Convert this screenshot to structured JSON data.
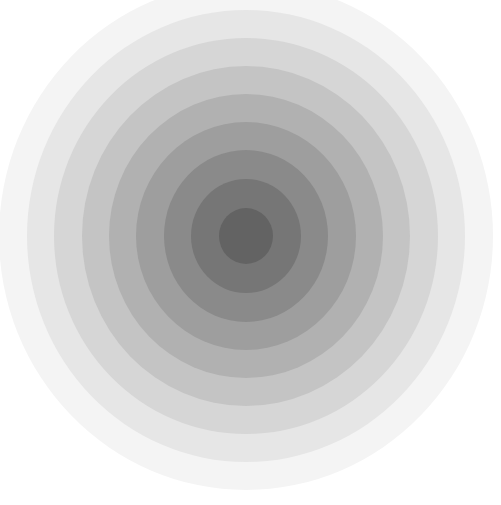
{
  "figure": {
    "center": {
      "x": 246,
      "y": 236
    },
    "rings": [
      {
        "rx": 247,
        "ry": 254,
        "color": "#f4f4f4"
      },
      {
        "rx": 219,
        "ry": 226,
        "color": "#e6e6e6"
      },
      {
        "rx": 192,
        "ry": 198,
        "color": "#d6d6d6"
      },
      {
        "rx": 164,
        "ry": 170,
        "color": "#c4c4c4"
      },
      {
        "rx": 137,
        "ry": 142,
        "color": "#b1b1b1"
      },
      {
        "rx": 110,
        "ry": 114,
        "color": "#9e9e9e"
      },
      {
        "rx": 82,
        "ry": 86,
        "color": "#8a8a8a"
      },
      {
        "rx": 55,
        "ry": 57,
        "color": "#767676"
      },
      {
        "rx": 27,
        "ry": 28,
        "color": "#636363"
      }
    ]
  }
}
